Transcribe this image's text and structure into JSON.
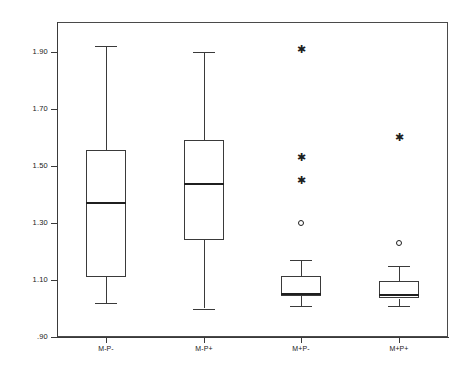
{
  "figure": {
    "background_color": "#ffffff",
    "line_color": "#3a3a3a",
    "frame": true,
    "grid": false
  },
  "axes": {
    "y_tick_labels": [
      "1.90",
      "1.70",
      "1.50",
      "1.30",
      "1.10",
      ".90"
    ],
    "y_tick_values": [
      1.9,
      1.7,
      1.5,
      1.3,
      1.1,
      0.9
    ],
    "x_tick_labels": [
      "M-P-",
      "M-P+",
      "M+P-",
      "M+P+"
    ],
    "ylim": [
      0.9,
      1.98
    ],
    "ylabel": "",
    "xlabel": "",
    "title": ""
  },
  "chart_data": {
    "type": "box",
    "title": "",
    "xlabel": "",
    "ylabel": "",
    "ylim": [
      0.9,
      1.98
    ],
    "grid": false,
    "legend": null,
    "categories": [
      "M-P-",
      "M-P+",
      "M+P-",
      "M+P+"
    ],
    "boxes": [
      {
        "category": "M-P-",
        "whisker_low": 1.02,
        "q1": 1.11,
        "median": 1.375,
        "q3": 1.555,
        "whisker_high": 1.92,
        "outliers_star": [],
        "outliers_circle": []
      },
      {
        "category": "M-P+",
        "whisker_low": 1.0,
        "q1": 1.24,
        "median": 1.44,
        "q3": 1.59,
        "whisker_high": 1.9,
        "outliers_star": [],
        "outliers_circle": []
      },
      {
        "category": "M+P-",
        "whisker_low": 1.01,
        "q1": 1.045,
        "median": 1.055,
        "q3": 1.115,
        "whisker_high": 1.17,
        "outliers_star": [
          1.91,
          1.53,
          1.45
        ],
        "outliers_circle": [
          1.3
        ]
      },
      {
        "category": "M+P+",
        "whisker_low": 1.01,
        "q1": 1.035,
        "median": 1.05,
        "q3": 1.095,
        "whisker_high": 1.15,
        "outliers_star": [
          1.6
        ],
        "outliers_circle": [
          1.23
        ]
      }
    ]
  }
}
